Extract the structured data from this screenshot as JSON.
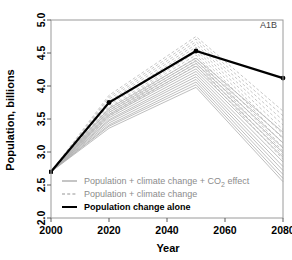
{
  "chart_data": {
    "type": "line",
    "title": "",
    "panel_label": "A1B",
    "xlabel": "Year",
    "ylabel": "Population, billions",
    "xlim": [
      2000,
      2080
    ],
    "ylim": [
      2.0,
      5.0
    ],
    "xticks": [
      2000,
      2020,
      2040,
      2060,
      2080
    ],
    "xtick_labels": [
      "2000",
      "2020",
      "2040",
      "2060",
      "2080"
    ],
    "yticks": [
      2.0,
      2.5,
      3.0,
      3.5,
      4.0,
      4.5,
      5.0
    ],
    "ytick_labels": [
      "2.0",
      "2.5",
      "3.0",
      "3.5",
      "4.0",
      "4.5",
      "5.0"
    ],
    "grid": false,
    "legend_position": "bottom-left",
    "x": [
      2000,
      2020,
      2050,
      2080
    ],
    "series": [
      {
        "name": "Population change alone",
        "style": "solid",
        "color": "#000000",
        "width": 2.2,
        "markers": true,
        "values": [
          2.7,
          3.75,
          4.53,
          4.12
        ]
      },
      {
        "name": "Population + climate change + CO2 effect",
        "style": "solid",
        "color": "#adadad",
        "width": 0.8,
        "markers": false,
        "ensemble": [
          [
            2.7,
            3.66,
            4.42,
            3.3
          ],
          [
            2.7,
            3.63,
            4.38,
            3.22
          ],
          [
            2.7,
            3.6,
            4.34,
            3.14
          ],
          [
            2.7,
            3.57,
            4.3,
            3.06
          ],
          [
            2.7,
            3.55,
            4.26,
            2.99
          ],
          [
            2.7,
            3.52,
            4.22,
            2.92
          ],
          [
            2.7,
            3.49,
            4.18,
            2.85
          ],
          [
            2.7,
            3.47,
            4.14,
            2.78
          ],
          [
            2.7,
            3.44,
            4.1,
            2.72
          ],
          [
            2.7,
            3.41,
            4.06,
            2.66
          ],
          [
            2.7,
            3.39,
            4.02,
            2.6
          ],
          [
            2.7,
            3.36,
            3.98,
            2.55
          ]
        ]
      },
      {
        "name": "Population + climate change",
        "style": "dashed",
        "color": "#b9b9b9",
        "width": 0.8,
        "markers": false,
        "ensemble": [
          [
            2.7,
            3.86,
            4.75,
            3.62
          ],
          [
            2.7,
            3.83,
            4.71,
            3.55
          ],
          [
            2.7,
            3.8,
            4.67,
            3.48
          ],
          [
            2.7,
            3.77,
            4.63,
            3.41
          ],
          [
            2.7,
            3.74,
            4.59,
            3.34
          ],
          [
            2.7,
            3.71,
            4.55,
            3.27
          ],
          [
            2.7,
            3.68,
            4.51,
            3.2
          ],
          [
            2.7,
            3.66,
            4.47,
            3.13
          ],
          [
            2.7,
            3.63,
            4.43,
            3.07
          ],
          [
            2.7,
            3.6,
            4.39,
            3.01
          ],
          [
            2.7,
            3.57,
            4.35,
            2.95
          ],
          [
            2.7,
            3.54,
            4.31,
            2.89
          ]
        ]
      }
    ]
  },
  "legend": {
    "items": [
      {
        "label": "Population + climate change + CO",
        "sub": "2",
        "tail": " effect",
        "style": "solid-gray"
      },
      {
        "label": "Population + climate change",
        "sub": "",
        "tail": "",
        "style": "dashed-gray"
      },
      {
        "label": "Population change alone",
        "sub": "",
        "tail": "",
        "style": "solid-black"
      }
    ]
  }
}
